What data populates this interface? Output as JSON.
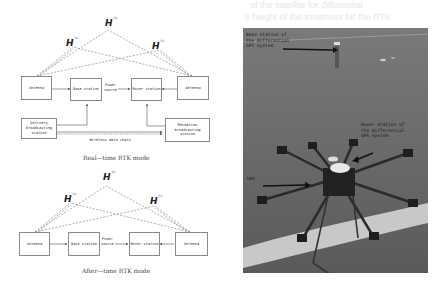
{
  "background_text": [
    "of the satellite for differential",
    "e height of the treatment for the RTK"
  ],
  "realtime": {
    "satellites": [
      {
        "symbol": "H",
        "sub": "S1"
      },
      {
        "symbol": "H",
        "sub": "S2"
      },
      {
        "symbol": "H",
        "sub": "S3"
      }
    ],
    "boxes": {
      "antenna_left": "Antenna",
      "base_station": "Base station",
      "rover_station": "Rover station",
      "antenna_right": "Antenna",
      "delivery": "Delivery broadcasting station",
      "reception": "Reception broadcasting station"
    },
    "power_source": "Power source",
    "wireless_chain": "Wireless data chain",
    "caption": "Real—time RTK mode"
  },
  "aftertime": {
    "satellites": [
      {
        "symbol": "H",
        "sub": "S1"
      },
      {
        "symbol": "H",
        "sub": "S2"
      },
      {
        "symbol": "H",
        "sub": "S3"
      }
    ],
    "boxes": {
      "antenna_left": "Antenna",
      "base_station": "Base station",
      "rover_station": "Rover station",
      "antenna_right": "Antenna"
    },
    "power_source": "Power source",
    "caption": "After—time RTK mode"
  },
  "photo": {
    "label_base": "Base station of the differential GPS system",
    "label_rover": "Rover station of the differential GPS system",
    "label_uav": "UAV",
    "colors": {
      "grass": "#6e6e6e",
      "line": "#cfcfcf"
    }
  }
}
